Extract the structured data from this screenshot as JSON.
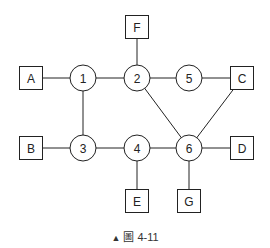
{
  "diagram": {
    "circles": [
      {
        "id": "1",
        "label": "1",
        "cx": 83,
        "cy": 78
      },
      {
        "id": "2",
        "label": "2",
        "cx": 137,
        "cy": 78
      },
      {
        "id": "5",
        "label": "5",
        "cx": 189,
        "cy": 78
      },
      {
        "id": "3",
        "label": "3",
        "cx": 83,
        "cy": 148
      },
      {
        "id": "4",
        "label": "4",
        "cx": 137,
        "cy": 148
      },
      {
        "id": "6",
        "label": "6",
        "cx": 189,
        "cy": 148
      }
    ],
    "boxes": [
      {
        "id": "A",
        "label": "A",
        "cx": 31,
        "cy": 78
      },
      {
        "id": "F",
        "label": "F",
        "cx": 137,
        "cy": 27
      },
      {
        "id": "C",
        "label": "C",
        "cx": 242,
        "cy": 78
      },
      {
        "id": "B",
        "label": "B",
        "cx": 31,
        "cy": 148
      },
      {
        "id": "D",
        "label": "D",
        "cx": 242,
        "cy": 148
      },
      {
        "id": "E",
        "label": "E",
        "cx": 137,
        "cy": 201
      },
      {
        "id": "G",
        "label": "G",
        "cx": 189,
        "cy": 201
      }
    ],
    "edges": [
      [
        "A",
        "1"
      ],
      [
        "1",
        "2"
      ],
      [
        "2",
        "5"
      ],
      [
        "5",
        "C"
      ],
      [
        "F",
        "2"
      ],
      [
        "1",
        "3"
      ],
      [
        "B",
        "3"
      ],
      [
        "3",
        "4"
      ],
      [
        "4",
        "6"
      ],
      [
        "6",
        "D"
      ],
      [
        "2",
        "6"
      ],
      [
        "C",
        "6"
      ],
      [
        "4",
        "E"
      ],
      [
        "6",
        "G"
      ]
    ],
    "circle_radius": 13,
    "box_size": 23,
    "stroke_color": "#222222"
  },
  "caption": {
    "marker": "▲",
    "text": "圖 4-11"
  }
}
